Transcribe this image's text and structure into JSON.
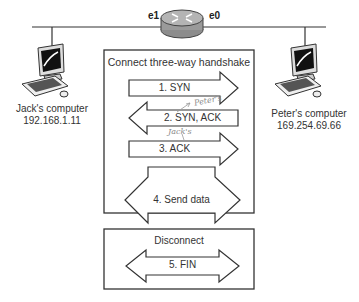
{
  "router": {
    "left_interface": "e1",
    "right_interface": "e0"
  },
  "hosts": [
    {
      "name": "Jack's computer",
      "ip": "192.168.1.11"
    },
    {
      "name": "Peter's computer",
      "ip": "169.254.69.66"
    }
  ],
  "handshake": {
    "title": "Connect three-way handshake",
    "steps": [
      {
        "label": "1. SYN",
        "direction": "right"
      },
      {
        "label": "2. SYN, ACK",
        "direction": "left"
      },
      {
        "label": "3. ACK",
        "direction": "right"
      }
    ],
    "annotations": [
      "Peter's",
      "Jack's"
    ]
  },
  "data_transfer": {
    "label": "4. Send data",
    "direction": "both"
  },
  "disconnect": {
    "title": "Disconnect",
    "step": {
      "label": "5. FIN",
      "direction": "both"
    }
  }
}
